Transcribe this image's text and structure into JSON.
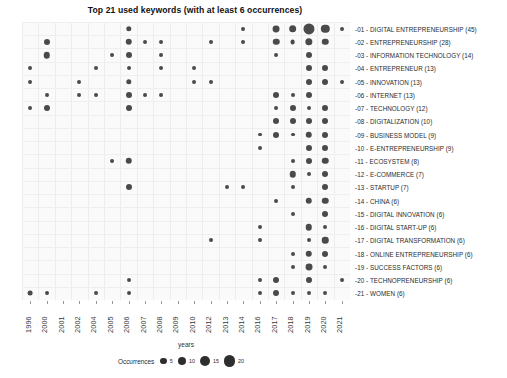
{
  "chart_data": {
    "type": "scatter",
    "title": "Top 21 used keywords (with at least 6 occurrences)",
    "xlabel": "years",
    "ylabel": "",
    "grid": true,
    "legend_position": "right",
    "size_legend": {
      "title": "Occurrences",
      "values": [
        5,
        10,
        15,
        20
      ]
    },
    "categories": [
      "1996",
      "2000",
      "2001",
      "2002",
      "2004",
      "2005",
      "2006",
      "2007",
      "2008",
      "2009",
      "2010",
      "2012",
      "2013",
      "2014",
      "2016",
      "2017",
      "2018",
      "2019",
      "2020",
      "2021"
    ],
    "keywords": [
      {
        "id": "01",
        "label": "-01 - DIGITAL ENTREPRENEURSHIP (45)",
        "name": "DIGITAL ENTREPRENEURSHIP",
        "total": 45
      },
      {
        "id": "02",
        "label": "-02 - ENTREPRENEURSHIP (28)",
        "name": "ENTREPRENEURSHIP",
        "total": 28
      },
      {
        "id": "03",
        "label": "-03 - INFORMATION TECHNOLOGY (14)",
        "name": "INFORMATION TECHNOLOGY",
        "total": 14
      },
      {
        "id": "04",
        "label": "-04 - ENTREPRENEUR (13)",
        "name": "ENTREPRENEUR",
        "total": 13
      },
      {
        "id": "05",
        "label": "-05 - INNOVATION (13)",
        "name": "INNOVATION",
        "total": 13
      },
      {
        "id": "06",
        "label": "-06 - INTERNET (13)",
        "name": "INTERNET",
        "total": 13
      },
      {
        "id": "07",
        "label": "-07 - TECHNOLOGY (12)",
        "name": "TECHNOLOGY",
        "total": 12
      },
      {
        "id": "08",
        "label": "-08 - DIGITALIZATION (10)",
        "name": "DIGITALIZATION",
        "total": 10
      },
      {
        "id": "09",
        "label": "-09 - BUSINESS MODEL (9)",
        "name": "BUSINESS MODEL",
        "total": 9
      },
      {
        "id": "10",
        "label": "-10 - E-ENTREPRENEURSHIP (9)",
        "name": "E-ENTREPRENEURSHIP",
        "total": 9
      },
      {
        "id": "11",
        "label": "-11 - ECOSYSTEM (8)",
        "name": "ECOSYSTEM",
        "total": 8
      },
      {
        "id": "12",
        "label": "-12 - E-COMMERCE (7)",
        "name": "E-COMMERCE",
        "total": 7
      },
      {
        "id": "13",
        "label": "-13 - STARTUP (7)",
        "name": "STARTUP",
        "total": 7
      },
      {
        "id": "14",
        "label": "-14 - CHINA (6)",
        "name": "CHINA",
        "total": 6
      },
      {
        "id": "15",
        "label": "-15 - DIGITAL INNOVATION (6)",
        "name": "DIGITAL INNOVATION",
        "total": 6
      },
      {
        "id": "16",
        "label": "-16 - DIGITAL START-UP (6)",
        "name": "DIGITAL START-UP",
        "total": 6
      },
      {
        "id": "17",
        "label": "-17 - DIGITAL TRANSFORMATION (6)",
        "name": "DIGITAL TRANSFORMATION",
        "total": 6
      },
      {
        "id": "18",
        "label": "-18 - ONLINE ENTREPRENEURSHIP (6)",
        "name": "ONLINE ENTREPRENEURSHIP",
        "total": 6
      },
      {
        "id": "19",
        "label": "-19 - SUCCESS FACTORS (6)",
        "name": "SUCCESS FACTORS",
        "total": 6
      },
      {
        "id": "20",
        "label": "-20 - TECHNOPRENEURSHIP (6)",
        "name": "TECHNOPRENEURSHIP",
        "total": 6
      },
      {
        "id": "21",
        "label": "-21 - WOMEN (6)",
        "name": "WOMEN",
        "total": 6
      }
    ],
    "points": [
      {
        "row": 0,
        "year": "2006",
        "value": 3
      },
      {
        "row": 0,
        "year": "2014",
        "value": 1
      },
      {
        "row": 0,
        "year": "2017",
        "value": 6
      },
      {
        "row": 0,
        "year": "2018",
        "value": 8
      },
      {
        "row": 0,
        "year": "2019",
        "value": 20
      },
      {
        "row": 0,
        "year": "2020",
        "value": 10
      },
      {
        "row": 0,
        "year": "2021",
        "value": 1
      },
      {
        "row": 1,
        "year": "2000",
        "value": 4
      },
      {
        "row": 1,
        "year": "2006",
        "value": 5
      },
      {
        "row": 1,
        "year": "2007",
        "value": 1
      },
      {
        "row": 1,
        "year": "2008",
        "value": 1
      },
      {
        "row": 1,
        "year": "2012",
        "value": 1
      },
      {
        "row": 1,
        "year": "2014",
        "value": 1
      },
      {
        "row": 1,
        "year": "2017",
        "value": 5
      },
      {
        "row": 1,
        "year": "2018",
        "value": 2
      },
      {
        "row": 1,
        "year": "2019",
        "value": 7
      },
      {
        "row": 1,
        "year": "2020",
        "value": 5
      },
      {
        "row": 2,
        "year": "2000",
        "value": 5
      },
      {
        "row": 2,
        "year": "2005",
        "value": 1
      },
      {
        "row": 2,
        "year": "2006",
        "value": 4
      },
      {
        "row": 2,
        "year": "2008",
        "value": 1
      },
      {
        "row": 2,
        "year": "2017",
        "value": 1
      },
      {
        "row": 2,
        "year": "2019",
        "value": 4
      },
      {
        "row": 3,
        "year": "1996",
        "value": 1
      },
      {
        "row": 3,
        "year": "2004",
        "value": 1
      },
      {
        "row": 3,
        "year": "2006",
        "value": 1
      },
      {
        "row": 3,
        "year": "2008",
        "value": 1
      },
      {
        "row": 3,
        "year": "2010",
        "value": 1
      },
      {
        "row": 3,
        "year": "2019",
        "value": 4
      },
      {
        "row": 3,
        "year": "2020",
        "value": 4
      },
      {
        "row": 4,
        "year": "1996",
        "value": 1
      },
      {
        "row": 4,
        "year": "2002",
        "value": 1
      },
      {
        "row": 4,
        "year": "2006",
        "value": 3
      },
      {
        "row": 4,
        "year": "2010",
        "value": 1
      },
      {
        "row": 4,
        "year": "2012",
        "value": 1
      },
      {
        "row": 4,
        "year": "2019",
        "value": 4
      },
      {
        "row": 4,
        "year": "2020",
        "value": 4
      },
      {
        "row": 4,
        "year": "2021",
        "value": 1
      },
      {
        "row": 5,
        "year": "2000",
        "value": 1
      },
      {
        "row": 5,
        "year": "2002",
        "value": 1
      },
      {
        "row": 5,
        "year": "2004",
        "value": 1
      },
      {
        "row": 5,
        "year": "2006",
        "value": 4
      },
      {
        "row": 5,
        "year": "2007",
        "value": 1
      },
      {
        "row": 5,
        "year": "2008",
        "value": 1
      },
      {
        "row": 5,
        "year": "2017",
        "value": 4
      },
      {
        "row": 5,
        "year": "2018",
        "value": 1
      },
      {
        "row": 5,
        "year": "2019",
        "value": 4
      },
      {
        "row": 6,
        "year": "1996",
        "value": 1
      },
      {
        "row": 6,
        "year": "2000",
        "value": 4
      },
      {
        "row": 6,
        "year": "2006",
        "value": 4
      },
      {
        "row": 6,
        "year": "2017",
        "value": 1
      },
      {
        "row": 6,
        "year": "2018",
        "value": 4
      },
      {
        "row": 6,
        "year": "2019",
        "value": 1
      },
      {
        "row": 6,
        "year": "2020",
        "value": 4
      },
      {
        "row": 7,
        "year": "2017",
        "value": 4
      },
      {
        "row": 7,
        "year": "2018",
        "value": 4
      },
      {
        "row": 7,
        "year": "2019",
        "value": 4
      },
      {
        "row": 7,
        "year": "2020",
        "value": 4
      },
      {
        "row": 8,
        "year": "2016",
        "value": 1
      },
      {
        "row": 8,
        "year": "2017",
        "value": 4
      },
      {
        "row": 8,
        "year": "2018",
        "value": 1
      },
      {
        "row": 8,
        "year": "2019",
        "value": 5
      },
      {
        "row": 8,
        "year": "2020",
        "value": 4
      },
      {
        "row": 9,
        "year": "2016",
        "value": 1
      },
      {
        "row": 9,
        "year": "2019",
        "value": 4
      },
      {
        "row": 9,
        "year": "2020",
        "value": 4
      },
      {
        "row": 10,
        "year": "2005",
        "value": 1
      },
      {
        "row": 10,
        "year": "2006",
        "value": 5
      },
      {
        "row": 10,
        "year": "2018",
        "value": 1
      },
      {
        "row": 10,
        "year": "2019",
        "value": 4
      },
      {
        "row": 10,
        "year": "2020",
        "value": 5
      },
      {
        "row": 11,
        "year": "2018",
        "value": 5
      },
      {
        "row": 11,
        "year": "2019",
        "value": 1
      },
      {
        "row": 11,
        "year": "2020",
        "value": 4
      },
      {
        "row": 12,
        "year": "2006",
        "value": 4
      },
      {
        "row": 12,
        "year": "2013",
        "value": 1
      },
      {
        "row": 12,
        "year": "2014",
        "value": 1
      },
      {
        "row": 12,
        "year": "2018",
        "value": 1
      },
      {
        "row": 12,
        "year": "2020",
        "value": 4
      },
      {
        "row": 13,
        "year": "2017",
        "value": 1
      },
      {
        "row": 13,
        "year": "2019",
        "value": 5
      },
      {
        "row": 13,
        "year": "2020",
        "value": 5
      },
      {
        "row": 14,
        "year": "2018",
        "value": 1
      },
      {
        "row": 14,
        "year": "2020",
        "value": 4
      },
      {
        "row": 15,
        "year": "2016",
        "value": 1
      },
      {
        "row": 15,
        "year": "2019",
        "value": 5
      },
      {
        "row": 15,
        "year": "2020",
        "value": 1
      },
      {
        "row": 16,
        "year": "2012",
        "value": 1
      },
      {
        "row": 16,
        "year": "2016",
        "value": 1
      },
      {
        "row": 16,
        "year": "2019",
        "value": 1
      },
      {
        "row": 16,
        "year": "2020",
        "value": 5
      },
      {
        "row": 17,
        "year": "2018",
        "value": 1
      },
      {
        "row": 17,
        "year": "2019",
        "value": 5
      },
      {
        "row": 17,
        "year": "2020",
        "value": 4
      },
      {
        "row": 18,
        "year": "2018",
        "value": 1
      },
      {
        "row": 18,
        "year": "2019",
        "value": 6
      },
      {
        "row": 18,
        "year": "2020",
        "value": 1
      },
      {
        "row": 19,
        "year": "2006",
        "value": 1
      },
      {
        "row": 19,
        "year": "2016",
        "value": 1
      },
      {
        "row": 19,
        "year": "2017",
        "value": 4
      },
      {
        "row": 19,
        "year": "2019",
        "value": 4
      },
      {
        "row": 19,
        "year": "2021",
        "value": 1
      },
      {
        "row": 20,
        "year": "1996",
        "value": 2
      },
      {
        "row": 20,
        "year": "2000",
        "value": 1
      },
      {
        "row": 20,
        "year": "2004",
        "value": 1
      },
      {
        "row": 20,
        "year": "2006",
        "value": 1
      },
      {
        "row": 20,
        "year": "2016",
        "value": 1
      },
      {
        "row": 20,
        "year": "2017",
        "value": 4
      },
      {
        "row": 20,
        "year": "2018",
        "value": 1
      },
      {
        "row": 20,
        "year": "2019",
        "value": 1
      },
      {
        "row": 20,
        "year": "2020",
        "value": 1
      }
    ],
    "colors": {
      "bubble": "#4a4a4a",
      "plot_background": "#fafafa",
      "grid": "#ededed",
      "text": "#2b2b2b"
    }
  }
}
